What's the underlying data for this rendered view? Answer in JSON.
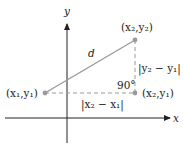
{
  "diagram": {
    "axes": {
      "x_label": "x",
      "y_label": "y"
    },
    "points": {
      "p1": {
        "label": "(x₁,y₁)"
      },
      "p2": {
        "label": "(x₂,y₂)"
      },
      "p3": {
        "label": "(x₂,y₁)"
      }
    },
    "distance_label": "d",
    "vertical_label": "|y₂ − y₁|",
    "horizontal_label": "|x₂ − x₁|",
    "angle_label": "90°",
    "colors": {
      "axis": "#222222",
      "segment": "#9a9a9a",
      "point": "#9a9a9a"
    }
  }
}
